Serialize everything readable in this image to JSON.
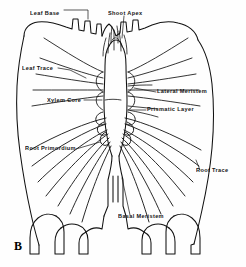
{
  "figure": {
    "letter": "B",
    "caption_letter_name": "figure-panel-letter",
    "ink_color": "#111111",
    "background_color": "#ffffff"
  },
  "labels": [
    {
      "id": "leaf-base",
      "text": "Leaf Base",
      "x": 30,
      "y": 11,
      "anchor": "left"
    },
    {
      "id": "shoot-apex",
      "text": "Shoot Apex",
      "x": 108,
      "y": 11,
      "anchor": "left"
    },
    {
      "id": "leaf-trace",
      "text": "Leaf Trace",
      "x": 26,
      "y": 67,
      "anchor": "left"
    },
    {
      "id": "xylem-core",
      "text": "Xylem Core",
      "x": 50,
      "y": 101,
      "anchor": "left"
    },
    {
      "id": "lateral-meristem",
      "text": "Lateral Meristem",
      "x": 157,
      "y": 93,
      "anchor": "left"
    },
    {
      "id": "prismatic-layer",
      "text": "Prismatic Layer",
      "x": 148,
      "y": 108,
      "anchor": "left"
    },
    {
      "id": "root-primordium",
      "text": "Root Primordium",
      "x": 28,
      "y": 148,
      "anchor": "left"
    },
    {
      "id": "root-trace",
      "text": "Root Trace",
      "x": 194,
      "y": 172,
      "anchor": "left"
    },
    {
      "id": "basal-meristem",
      "text": "Basal Meristem",
      "x": 118,
      "y": 218,
      "anchor": "left"
    }
  ]
}
